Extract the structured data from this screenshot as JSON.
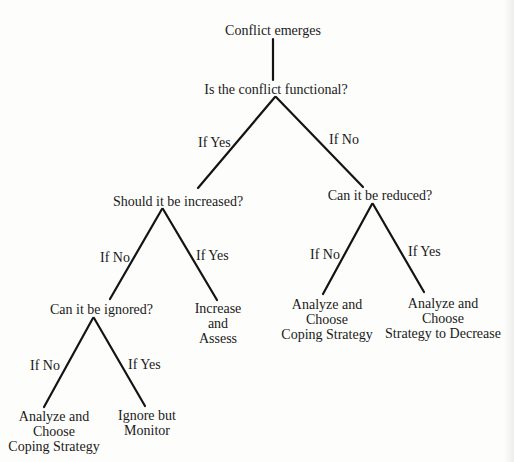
{
  "diagram": {
    "type": "decision-tree",
    "nodes": {
      "root": "Conflict emerges",
      "q_functional": "Is the conflict functional?",
      "q_increase": "Should it be increased?",
      "q_reduce": "Can it be reduced?",
      "q_ignore": "Can it be ignored?",
      "out_increase": [
        "Increase",
        "and",
        "Assess"
      ],
      "out_reduce_no": [
        "Analyze and",
        "Choose",
        "Coping Strategy"
      ],
      "out_reduce_yes": [
        "Analyze and",
        "Choose",
        "Strategy to Decrease"
      ],
      "out_ignore_no": [
        "Analyze and",
        "Choose",
        "Coping Strategy"
      ],
      "out_ignore_yes": [
        "Ignore but",
        "Monitor"
      ]
    },
    "edge_labels": {
      "functional_yes": "If Yes",
      "functional_no": "If No",
      "increase_no": "If No",
      "increase_yes": "If Yes",
      "reduce_no": "If No",
      "reduce_yes": "If Yes",
      "ignore_no": "If No",
      "ignore_yes": "If Yes"
    },
    "edges": [
      {
        "from": "root",
        "to": "q_functional"
      },
      {
        "from": "q_functional",
        "to": "q_increase",
        "label": "If Yes"
      },
      {
        "from": "q_functional",
        "to": "q_reduce",
        "label": "If No"
      },
      {
        "from": "q_increase",
        "to": "q_ignore",
        "label": "If No"
      },
      {
        "from": "q_increase",
        "to": "out_increase",
        "label": "If Yes"
      },
      {
        "from": "q_reduce",
        "to": "out_reduce_no",
        "label": "If No"
      },
      {
        "from": "q_reduce",
        "to": "out_reduce_yes",
        "label": "If Yes"
      },
      {
        "from": "q_ignore",
        "to": "out_ignore_no",
        "label": "If No"
      },
      {
        "from": "q_ignore",
        "to": "out_ignore_yes",
        "label": "If Yes"
      }
    ]
  }
}
